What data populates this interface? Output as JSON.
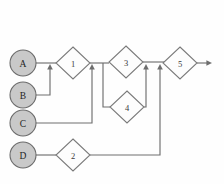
{
  "diagram": {
    "type": "flow-network",
    "canvas": {
      "width": 224,
      "height": 184
    },
    "colors": {
      "circle_fill": "#c9c9c9",
      "circle_stroke": "#6b6b6b",
      "diamond_fill": "#fdfdfd",
      "diamond_stroke": "#7a7a7a",
      "line": "#6e6e6e",
      "background": "#fefefe",
      "label": "#2a2a2a"
    },
    "sources": [
      {
        "id": "A",
        "label": "A",
        "cx": 23,
        "cy": 63,
        "r": 13
      },
      {
        "id": "B",
        "label": "B",
        "cx": 23,
        "cy": 95,
        "r": 13
      },
      {
        "id": "C",
        "label": "C",
        "cx": 23,
        "cy": 123,
        "r": 13
      },
      {
        "id": "D",
        "label": "D",
        "cx": 23,
        "cy": 155,
        "r": 13
      }
    ],
    "processes": [
      {
        "id": "1",
        "label": "1",
        "cx": 73,
        "cy": 63,
        "rx": 17,
        "ry": 16
      },
      {
        "id": "2",
        "label": "2",
        "cx": 73,
        "cy": 155,
        "rx": 17,
        "ry": 16
      },
      {
        "id": "3",
        "label": "3",
        "cx": 126,
        "cy": 62,
        "rx": 17,
        "ry": 16
      },
      {
        "id": "4",
        "label": "4",
        "cx": 127,
        "cy": 107,
        "rx": 17,
        "ry": 16
      },
      {
        "id": "5",
        "label": "5",
        "cx": 180,
        "cy": 63,
        "rx": 17,
        "ry": 16
      }
    ],
    "links": [
      {
        "id": "a-to-1",
        "from": "A",
        "to": "1",
        "path": "M 36 63 L 56 63",
        "arrow": null
      },
      {
        "id": "b-to-trunk",
        "from": "B",
        "to": "1",
        "path": "M 36 95 L 50 95 L 50 68",
        "arrow": {
          "x": 50,
          "y": 64,
          "dir": "up"
        }
      },
      {
        "id": "c-to-trunk",
        "from": "C",
        "to": "1-out",
        "path": "M 36 123 L 92 123 L 92 68",
        "arrow": {
          "x": 92,
          "y": 64,
          "dir": "up"
        }
      },
      {
        "id": "d-to-2",
        "from": "D",
        "to": "2",
        "path": "M 36 155 L 56 155",
        "arrow": null
      },
      {
        "id": "1-to-3",
        "from": "1",
        "to": "3",
        "path": "M 90 63 L 109 63",
        "arrow": null
      },
      {
        "id": "3-branch-in",
        "from": "1-out",
        "to": "4",
        "path": "M 103 63 L 103 107 L 110 107",
        "arrow": null
      },
      {
        "id": "4-to-merge",
        "from": "4",
        "to": "5",
        "path": "M 144 107 L 146 107 L 146 68",
        "arrow": {
          "x": 146,
          "y": 64,
          "dir": "up"
        }
      },
      {
        "id": "3-to-merge",
        "from": "3",
        "to": "5",
        "path": "M 143 62 L 166 62",
        "arrow": null
      },
      {
        "id": "2-to-merge",
        "from": "2",
        "to": "5",
        "path": "M 90 155 L 160 155 L 160 68",
        "arrow": {
          "x": 160,
          "y": 64,
          "dir": "up"
        }
      },
      {
        "id": "5-output",
        "from": "5",
        "to": "out",
        "path": "M 197 63 L 208 63",
        "arrow": {
          "x": 212,
          "y": 63,
          "dir": "right"
        }
      }
    ],
    "caption": ""
  }
}
